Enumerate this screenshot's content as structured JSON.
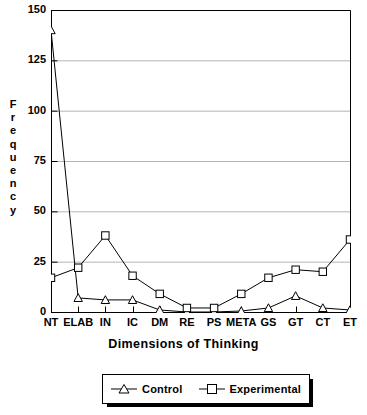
{
  "chart_data": {
    "type": "line",
    "title": "",
    "xlabel": "Dimensions of Thinking",
    "ylabel": "Frequency",
    "categories": [
      "NT",
      "ELAB",
      "IN",
      "IC",
      "DM",
      "RE",
      "PS",
      "META",
      "GS",
      "GT",
      "CT",
      "ET"
    ],
    "series": [
      {
        "name": "Control",
        "marker": "triangle",
        "values": [
          140,
          7,
          6,
          6,
          1,
          0,
          0,
          0.5,
          2,
          8,
          2,
          1
        ]
      },
      {
        "name": "Experimental",
        "marker": "square",
        "values": [
          17,
          22,
          38,
          18,
          9,
          2,
          2,
          9,
          17,
          21,
          20,
          36
        ]
      }
    ],
    "ylim": [
      0,
      150
    ],
    "yticks": [
      0,
      25,
      50,
      75,
      100,
      125,
      150
    ],
    "ytick_labels": [
      "0",
      "25",
      "50",
      "75",
      "100",
      "125",
      "150"
    ],
    "grid": true,
    "grid_axis": "y",
    "legend_position": "below-plot",
    "colors": {
      "line": "#000000",
      "grid": "#b4b4b4",
      "axis": "#000000",
      "background": "#ffffff"
    }
  },
  "axes": {
    "y_title_letters": [
      "F",
      "r",
      "e",
      "q",
      "u",
      "e",
      "n",
      "c",
      "y"
    ]
  },
  "legend": {
    "entries": [
      {
        "label": "Control"
      },
      {
        "label": "Experimental"
      }
    ]
  }
}
